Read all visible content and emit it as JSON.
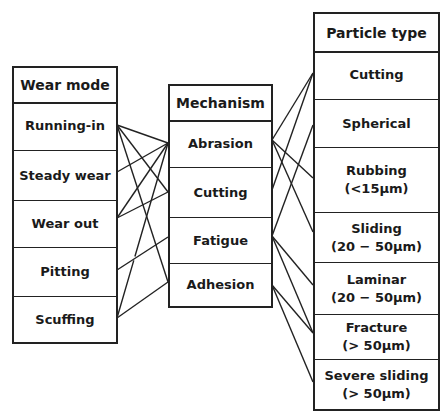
{
  "wear_mode": {
    "header": "Wear mode",
    "items": [
      "Running-in",
      "Steady wear",
      "Wear out",
      "Pitting",
      "Scuffing"
    ]
  },
  "mechanism": {
    "header": "Mechanism",
    "items": [
      "Abrasion",
      "Cutting",
      "Fatigue",
      "Adhesion"
    ]
  },
  "particle_type": {
    "header": "Particle type",
    "items": [
      "Cutting",
      "Spherical",
      "Rubbing\n(<15µm)",
      "Sliding\n(20 − 50µm)",
      "Laminar\n(20 − 50µm)",
      "Fracture\n(> 50µm)",
      "Severe sliding\n(> 50µm)"
    ]
  },
  "links_wear_to_mechanism": [
    [
      "Running-in",
      "Abrasion"
    ],
    [
      "Running-in",
      "Cutting"
    ],
    [
      "Running-in",
      "Adhesion"
    ],
    [
      "Steady wear",
      "Abrasion"
    ],
    [
      "Wear out",
      "Abrasion"
    ],
    [
      "Wear out",
      "Cutting"
    ],
    [
      "Pitting",
      "Fatigue"
    ],
    [
      "Scuffing",
      "Abrasion"
    ],
    [
      "Scuffing",
      "Adhesion"
    ]
  ],
  "links_mechanism_to_particle": [
    [
      "Abrasion",
      "Cutting"
    ],
    [
      "Abrasion",
      "Rubbing"
    ],
    [
      "Abrasion",
      "Sliding"
    ],
    [
      "Cutting",
      "Cutting"
    ],
    [
      "Fatigue",
      "Spherical"
    ],
    [
      "Fatigue",
      "Laminar"
    ],
    [
      "Fatigue",
      "Fracture"
    ],
    [
      "Adhesion",
      "Fracture"
    ],
    [
      "Adhesion",
      "Severe sliding"
    ]
  ]
}
